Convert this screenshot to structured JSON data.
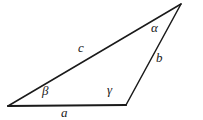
{
  "figure": {
    "kind": "geometry-diagram",
    "shape": "triangle",
    "background_color": "#ffffff",
    "stroke_color": "#1a1a1a",
    "label_color": "#1a1a1a"
  },
  "vertices": {
    "bottom_left": {
      "x": 8,
      "y": 106
    },
    "bottom_right": {
      "x": 126,
      "y": 105
    },
    "apex": {
      "x": 181,
      "y": 4
    }
  },
  "edges": [
    {
      "id": "a",
      "from": "bottom_left",
      "to": "bottom_right",
      "stroke_width": 2.2
    },
    {
      "id": "b",
      "from": "bottom_right",
      "to": "apex",
      "stroke_width": 1.5
    },
    {
      "id": "c",
      "from": "bottom_left",
      "to": "apex",
      "stroke_width": 1.5
    }
  ],
  "side_labels": {
    "a": "a",
    "b": "b",
    "c": "c"
  },
  "angle_labels": {
    "alpha": "α",
    "beta": "β",
    "gamma": "γ"
  }
}
